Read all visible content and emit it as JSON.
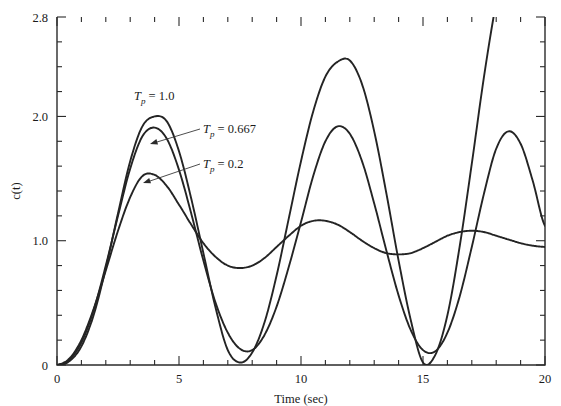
{
  "figure": {
    "title": "",
    "background_color": "#ffffff",
    "curve_color": "#242424",
    "axis_color": "#2b2b2b"
  },
  "axes": {
    "x": {
      "label": "Time (sec)",
      "min": 0,
      "max": 20,
      "major_ticks": [
        0,
        5,
        10,
        15,
        20
      ],
      "major_tick_labels": [
        "0",
        "5",
        "10",
        "15",
        "20"
      ],
      "minor_tick_step": 1
    },
    "y": {
      "label": "c(t)",
      "min": 0,
      "max": 2.8,
      "major_ticks": [
        0,
        1.0,
        2.0,
        2.8
      ],
      "major_tick_labels": [
        "0",
        "1.0",
        "2.0",
        "2.8"
      ],
      "minor_tick_step": 0.2
    }
  },
  "annotations": [
    {
      "id": "ann-tp-1",
      "symbol": "T",
      "subscript": "p",
      "text": " = 1.0",
      "full": "Tp = 1.0",
      "x": 134,
      "y": 100,
      "has_leader": false
    },
    {
      "id": "ann-tp-0667",
      "symbol": "T",
      "subscript": "p",
      "text": " = 0.667",
      "full": "Tp = 0.667",
      "x": 203,
      "y": 133,
      "has_leader": true
    },
    {
      "id": "ann-tp-02",
      "symbol": "T",
      "subscript": "p",
      "text": " = 0.2",
      "full": "Tp = 0.2",
      "x": 203,
      "y": 168,
      "has_leader": true
    }
  ],
  "chart_data": {
    "type": "line",
    "title": "",
    "xlabel": "Time (sec)",
    "ylabel": "c(t)",
    "xlim": [
      0,
      20
    ],
    "ylim": [
      0,
      2.8
    ],
    "grid": false,
    "legend_position": "inline-annotations",
    "x_ticks": [
      0,
      5,
      10,
      15,
      20
    ],
    "y_ticks": [
      0,
      1.0,
      2.0,
      2.8
    ],
    "series": [
      {
        "name": "Tp = 0.2",
        "label": "Tp = 0.2",
        "peak_time": 0.2,
        "color": "#242424",
        "description": "Most heavily damped response; first peak ~1.53 near t=3.5, settles toward 1.0 with small ripples",
        "x": [
          0,
          0.5,
          1.0,
          1.5,
          2.0,
          2.5,
          3.0,
          3.5,
          4.0,
          4.5,
          5.0,
          5.5,
          6.0,
          6.5,
          7.0,
          7.5,
          8.0,
          8.5,
          9.0,
          9.5,
          10.0,
          10.5,
          11.0,
          11.5,
          12.0,
          12.5,
          13.0,
          13.5,
          14.0,
          14.5,
          15.0,
          15.5,
          16.0,
          16.5,
          17.0,
          17.5,
          18.0,
          18.5,
          19.0,
          19.5,
          20.0
        ],
        "y": [
          0.0,
          0.05,
          0.2,
          0.45,
          0.76,
          1.08,
          1.35,
          1.52,
          1.53,
          1.44,
          1.29,
          1.13,
          0.98,
          0.87,
          0.8,
          0.78,
          0.8,
          0.86,
          0.95,
          1.04,
          1.12,
          1.16,
          1.16,
          1.13,
          1.07,
          1.0,
          0.94,
          0.9,
          0.89,
          0.9,
          0.94,
          0.99,
          1.04,
          1.07,
          1.08,
          1.07,
          1.04,
          1.01,
          0.98,
          0.96,
          0.95
        ]
      },
      {
        "name": "Tp = 0.667",
        "label": "Tp = 0.667",
        "peak_time": 0.667,
        "color": "#242424",
        "description": "Intermediate damping; first peak ~1.90 near t=3.9, second peak ~1.92 near t=11.3, third peak ~1.88 near t=18.5",
        "x": [
          0,
          0.5,
          1.0,
          1.5,
          2.0,
          2.5,
          3.0,
          3.5,
          4.0,
          4.5,
          5.0,
          5.5,
          6.0,
          6.5,
          7.0,
          7.5,
          8.0,
          8.5,
          9.0,
          9.5,
          10.0,
          10.5,
          11.0,
          11.5,
          12.0,
          12.5,
          13.0,
          13.5,
          14.0,
          14.5,
          15.0,
          15.5,
          16.0,
          16.5,
          17.0,
          17.5,
          18.0,
          18.5,
          19.0,
          19.5,
          20.0
        ],
        "y": [
          0.0,
          0.04,
          0.18,
          0.44,
          0.8,
          1.2,
          1.58,
          1.84,
          1.91,
          1.82,
          1.57,
          1.22,
          0.84,
          0.5,
          0.26,
          0.13,
          0.12,
          0.24,
          0.47,
          0.79,
          1.15,
          1.52,
          1.8,
          1.92,
          1.86,
          1.64,
          1.3,
          0.92,
          0.56,
          0.28,
          0.12,
          0.11,
          0.26,
          0.55,
          0.95,
          1.38,
          1.74,
          1.88,
          1.78,
          1.48,
          1.12
        ]
      },
      {
        "name": "Tp = 1.0",
        "label": "Tp = 1.0",
        "peak_time": 1.0,
        "color": "#242424",
        "description": "Least damped, largest overshoot; first peak ~2.00 near t=4.3, second peak ~2.45 near t=12.4, rises steeply off-scale past t=19",
        "x": [
          0,
          0.5,
          1.0,
          1.5,
          2.0,
          2.5,
          3.0,
          3.5,
          4.0,
          4.5,
          5.0,
          5.5,
          6.0,
          6.5,
          7.0,
          7.5,
          8.0,
          8.5,
          9.0,
          9.5,
          10.0,
          10.5,
          11.0,
          11.5,
          12.0,
          12.5,
          13.0,
          13.5,
          14.0,
          14.5,
          15.0,
          15.5,
          16.0,
          16.5,
          17.0,
          17.5,
          18.0,
          18.5,
          19.0,
          19.5,
          20.0
        ],
        "y": [
          0.0,
          0.03,
          0.15,
          0.4,
          0.78,
          1.22,
          1.64,
          1.92,
          2.0,
          1.96,
          1.72,
          1.34,
          0.9,
          0.46,
          0.12,
          0.02,
          0.1,
          0.34,
          0.72,
          1.18,
          1.64,
          2.04,
          2.32,
          2.44,
          2.45,
          2.26,
          1.88,
          1.38,
          0.84,
          0.36,
          0.02,
          0.08,
          0.4,
          0.95,
          1.62,
          2.32,
          2.92,
          3.4,
          3.74,
          3.92,
          4.0
        ]
      }
    ]
  }
}
